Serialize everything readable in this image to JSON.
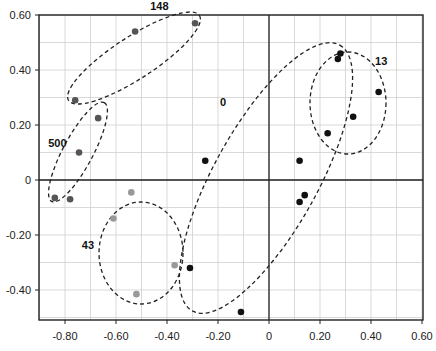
{
  "chart_data": {
    "type": "scatter",
    "title": "",
    "xlabel": "",
    "ylabel": "",
    "xlim": [
      -0.9,
      0.6
    ],
    "ylim": [
      -0.51,
      0.6
    ],
    "grid": true,
    "x_ticks": [
      "-0.80",
      "-0.60",
      "-0.40",
      "-0.20",
      "0",
      "0.20",
      "0.40",
      "0.60"
    ],
    "x_tick_values": [
      -0.8,
      -0.6,
      -0.4,
      -0.2,
      0,
      0.2,
      0.4,
      0.6
    ],
    "y_ticks": [
      "0.60",
      "0.40",
      "0.20",
      "0",
      "-0.20",
      "-0.40"
    ],
    "y_tick_values": [
      0.6,
      0.4,
      0.2,
      0,
      -0.2,
      -0.4
    ],
    "series": [
      {
        "name": "148",
        "color": "#555555",
        "points": [
          [
            -0.525,
            0.54
          ],
          [
            -0.29,
            0.57
          ],
          [
            -0.76,
            0.29
          ]
        ]
      },
      {
        "name": "500",
        "color": "#555555",
        "points": [
          [
            -0.67,
            0.225
          ],
          [
            -0.745,
            0.1
          ],
          [
            -0.84,
            -0.065
          ],
          [
            -0.78,
            -0.07
          ]
        ]
      },
      {
        "name": "43",
        "color": "#999999",
        "points": [
          [
            -0.54,
            -0.045
          ],
          [
            -0.61,
            -0.14
          ],
          [
            -0.37,
            -0.31
          ],
          [
            -0.52,
            -0.415
          ]
        ]
      },
      {
        "name": "0",
        "color": "#111111",
        "points": [
          [
            -0.25,
            0.07
          ],
          [
            -0.31,
            -0.32
          ],
          [
            -0.11,
            -0.48
          ],
          [
            0.12,
            0.07
          ],
          [
            0.14,
            -0.055
          ],
          [
            0.12,
            -0.08
          ]
        ]
      },
      {
        "name": "13",
        "color": "#111111",
        "points": [
          [
            0.27,
            0.44
          ],
          [
            0.28,
            0.46
          ],
          [
            0.43,
            0.32
          ],
          [
            0.33,
            0.23
          ],
          [
            0.23,
            0.17
          ]
        ]
      }
    ],
    "group_labels": [
      {
        "text": "148",
        "x": -0.43,
        "y": 0.62
      },
      {
        "text": "500",
        "x": -0.83,
        "y": 0.12
      },
      {
        "text": "43",
        "x": -0.71,
        "y": -0.25
      },
      {
        "text": "0",
        "x": -0.18,
        "y": 0.27
      },
      {
        "text": "13",
        "x": 0.44,
        "y": 0.42
      }
    ]
  }
}
